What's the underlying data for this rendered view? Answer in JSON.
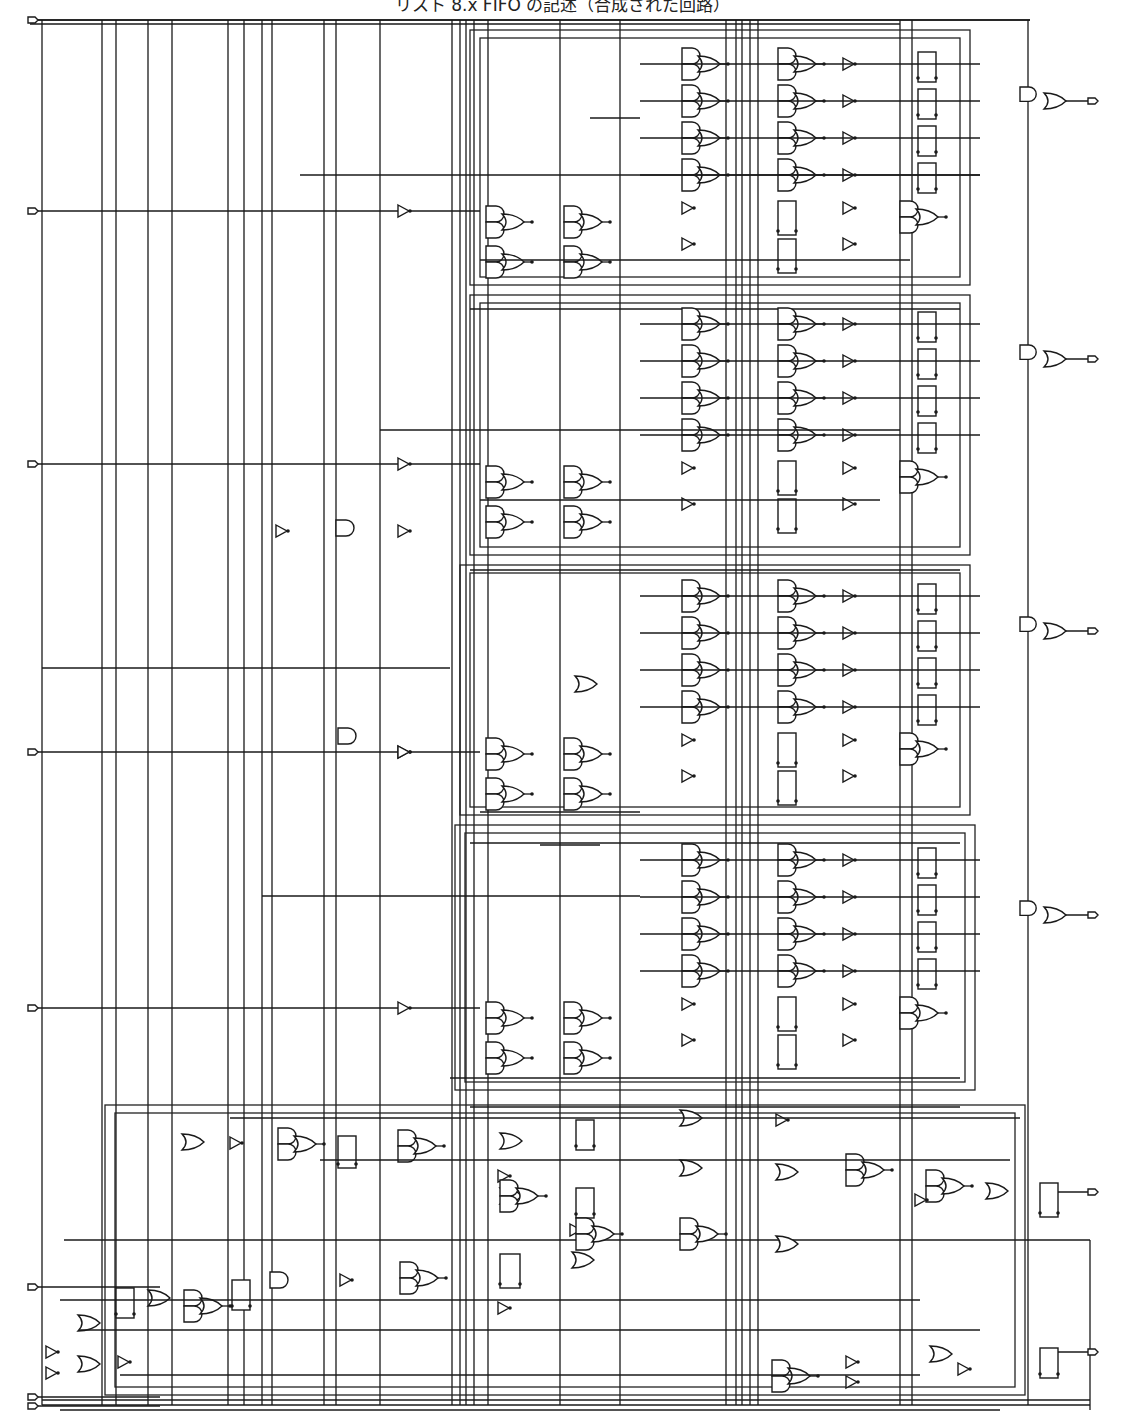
{
  "title": "リスト 8.x FIFO の記述（合成された回路）",
  "ports": {
    "inputs": [
      {
        "name": "CLK",
        "y": 20
      },
      {
        "name": "DATAIN[3]",
        "y": 211
      },
      {
        "name": "DATAIN[2]",
        "y": 464
      },
      {
        "name": "DATAIN[1]",
        "y": 752
      },
      {
        "name": "DATAIN[0]",
        "y": 1008
      },
      {
        "name": "RESET",
        "y": 1287
      },
      {
        "name": "WE",
        "y": 1397
      },
      {
        "name": "RE",
        "y": 1406
      }
    ],
    "outputs": [
      {
        "name": "DATAOUT[3]",
        "y": 101
      },
      {
        "name": "DATAOUT[2]",
        "y": 359
      },
      {
        "name": "DATAOUT[1]",
        "y": 631
      },
      {
        "name": "DATAOUT[0]",
        "y": 915
      },
      {
        "name": "EMPTY",
        "y": 1192
      },
      {
        "name": "FULL",
        "y": 1352
      }
    ]
  },
  "blocks": [
    {
      "name": "bit3",
      "x": 470,
      "y": 30,
      "w": 500,
      "h": 255
    },
    {
      "name": "bit2",
      "x": 470,
      "y": 295,
      "w": 500,
      "h": 260
    },
    {
      "name": "bit1",
      "x": 460,
      "y": 565,
      "w": 510,
      "h": 250
    },
    {
      "name": "bit0",
      "x": 455,
      "y": 825,
      "w": 520,
      "h": 265
    },
    {
      "name": "control",
      "x": 105,
      "y": 1105,
      "w": 920,
      "h": 290
    }
  ]
}
